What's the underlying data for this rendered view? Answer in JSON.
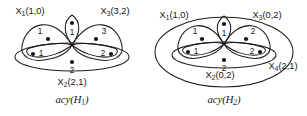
{
  "figure": {
    "background_color": "#ffffff",
    "ink_color": "#141414",
    "panels": [
      {
        "id": "left",
        "caption_text": "acy(H",
        "caption_sub": "1",
        "caption_tail": ")",
        "caption_full": "acy(H1)",
        "hyperedge_labels": [
          {
            "name": "X1",
            "base": "X",
            "sub": "1",
            "args": "(1,0)",
            "full": "X1(1,0)",
            "position": "top-left"
          },
          {
            "name": "X3",
            "base": "X",
            "sub": "3",
            "args": "(3,2)",
            "full": "X3(3,2)",
            "position": "top-right"
          },
          {
            "name": "X2",
            "base": "X",
            "sub": "2",
            "args": "(2,1)",
            "full": "X2(2,1)",
            "position": "bottom-center"
          }
        ],
        "vertices": [
          {
            "id": "top",
            "label": "1",
            "label_pos": "below"
          },
          {
            "id": "upper-left",
            "label": "1",
            "label_pos": "left-above"
          },
          {
            "id": "upper-right",
            "label": "3",
            "label_pos": "right-above"
          },
          {
            "id": "lower-left",
            "label": "1",
            "label_pos": "right"
          },
          {
            "id": "lower-right",
            "label": "2",
            "label_pos": "left"
          },
          {
            "id": "bottom",
            "label": "2",
            "label_pos": "below"
          }
        ]
      },
      {
        "id": "right",
        "caption_text": "acy(H",
        "caption_sub": "2",
        "caption_tail": ")",
        "caption_full": "acy(H2)",
        "hyperedge_labels": [
          {
            "name": "X1",
            "base": "X",
            "sub": "1",
            "args": "(1,0)",
            "full": "X1(1,0)",
            "position": "top-left"
          },
          {
            "name": "X3",
            "base": "X",
            "sub": "3",
            "args": "(0,2)",
            "full": "X3(0,2)",
            "position": "top-right"
          },
          {
            "name": "X4",
            "base": "X",
            "sub": "4",
            "args": "(2,1)",
            "full": "X4(2,1)",
            "position": "right"
          },
          {
            "name": "X2",
            "base": "X",
            "sub": "2",
            "args": "(0,2)",
            "full": "X2(0,2)",
            "position": "bottom-center"
          }
        ],
        "vertices": [
          {
            "id": "top",
            "label": "1",
            "label_pos": "below"
          },
          {
            "id": "upper-left",
            "label": "1",
            "label_pos": "left-above"
          },
          {
            "id": "upper-right",
            "label": "2",
            "label_pos": "right-above"
          },
          {
            "id": "lower-left",
            "label": "1",
            "label_pos": "right"
          },
          {
            "id": "lower-right",
            "label": "2",
            "label_pos": "left"
          },
          {
            "id": "bottom",
            "label": "2",
            "label_pos": "below"
          }
        ]
      }
    ]
  }
}
